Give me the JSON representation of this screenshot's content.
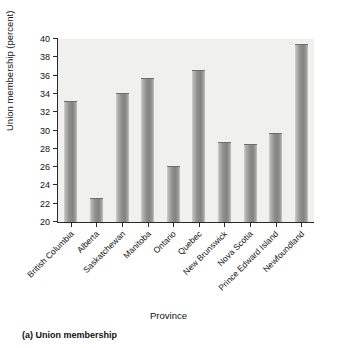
{
  "chart_data": {
    "type": "bar",
    "title": "",
    "caption": "(a) Union membership",
    "xlabel": "Province",
    "ylabel": "Union membership (percent)",
    "ylim": [
      20,
      40
    ],
    "yticks": [
      20,
      22,
      24,
      26,
      28,
      30,
      32,
      34,
      36,
      38,
      40
    ],
    "grid": false,
    "legend": null,
    "plot_background": "#f0f0ee",
    "bar_color": "#8e8e8c",
    "axis_color": "#2a2a2a",
    "categories": [
      "British Columbia",
      "Alberta",
      "Saskatchewan",
      "Manitoba",
      "Ontario",
      "Quebec",
      "New Brunswick",
      "Nova Scotia",
      "Prince Edward Island",
      "Newfoundland"
    ],
    "values": [
      33.1,
      22.5,
      34.0,
      35.6,
      26.0,
      36.5,
      28.6,
      28.4,
      29.6,
      39.4
    ]
  }
}
